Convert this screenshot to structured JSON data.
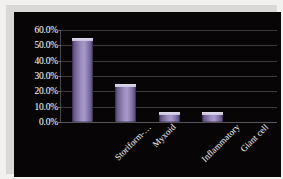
{
  "chart_data": {
    "type": "bar",
    "title": "",
    "subtitle": "",
    "xlabel": "",
    "ylabel": "",
    "categories": [
      "Storiform-…",
      "Myxoid",
      "Inflammatory",
      "Giant cell",
      "Angiomatoid"
    ],
    "values": [
      54.5,
      24.5,
      6.5,
      6.5,
      0.0
    ],
    "series": [
      {
        "name": "",
        "values": [
          54.5,
          24.5,
          6.5,
          6.5,
          0.0
        ]
      }
    ],
    "ylim": [
      0,
      60
    ],
    "ytick_labels": [
      "60.0%",
      "50.0%",
      "40.0%",
      "30.0%",
      "20.0%",
      "10.0%",
      "0.0%"
    ],
    "ytick_values": [
      60,
      50,
      40,
      30,
      20,
      10,
      0
    ],
    "grid": true,
    "legend": "none",
    "value_unit": "%"
  },
  "style": {
    "background_color": "#070506",
    "frame_color": "#d8d8d6",
    "gridline_color": "#3a3a3c",
    "bar_color": "#9a8cbd",
    "bar_edge_color": "#4a3f63",
    "text_color": "#efeff2"
  }
}
